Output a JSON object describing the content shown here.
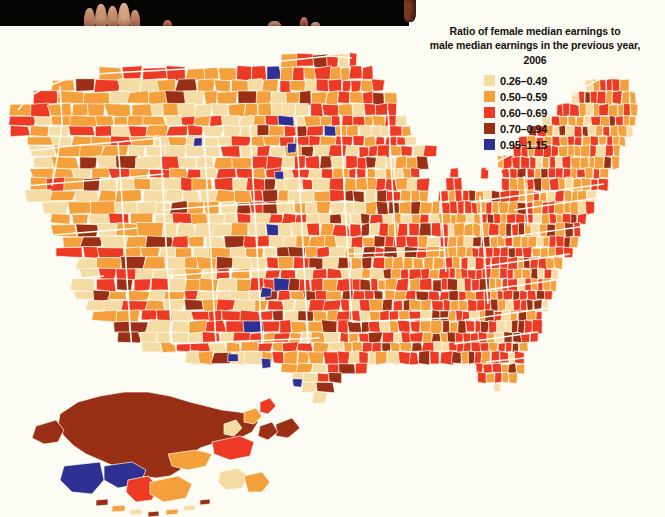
{
  "photo": {
    "band_color": "#060403",
    "description_name": "book-page-photo-band",
    "fingertips": 9
  },
  "legend": {
    "title_line1": "Ratio of female median earnings to",
    "title_line2": "male median earnings in the previous year,",
    "title_line3": "2006",
    "title_full": "Ratio of female median earnings to\nmale median earnings in the previous year,\n2006",
    "items": [
      {
        "label": "0.26–0.49",
        "color": "#f5dba4",
        "min": 0.26,
        "max": 0.49
      },
      {
        "label": "0.50–0.59",
        "color": "#f4a03c",
        "min": 0.5,
        "max": 0.59
      },
      {
        "label": "0.60–0.69",
        "color": "#ed3a24",
        "min": 0.6,
        "max": 0.69
      },
      {
        "label": "0.70–0.94",
        "color": "#993016",
        "min": 0.7,
        "max": 0.94
      },
      {
        "label": "0.95–1.15",
        "color": "#2e3192",
        "min": 0.95,
        "max": 1.15
      }
    ]
  },
  "map": {
    "name": "united-states-county-choropleth",
    "background": "#fdfcf4",
    "border_color": "#fdfcf4",
    "insets": [
      "Alaska",
      "Hawaii"
    ],
    "regions_summary": {
      "west_large_counties": "mostly 0.26–0.49 and 0.50–0.59",
      "southeast": "dense 0.60–0.69 with scattered 0.70–0.94",
      "northeast": "mixed 0.50–0.59 and 0.60–0.69",
      "great_plains_blue_outliers": 6,
      "alaska": "mostly 0.70–0.94 with 0.95–1.15 and 0.50–0.59 areas",
      "hawaii": "0.50–0.59 and 0.70–0.94"
    }
  },
  "chart_data": {
    "type": "map",
    "title": "Ratio of female median earnings to male median earnings in the previous year, 2006",
    "geography": "United States counties",
    "bins": [
      {
        "range": "0.26–0.49",
        "color": "#f5dba4"
      },
      {
        "range": "0.50–0.59",
        "color": "#f4a03c"
      },
      {
        "range": "0.60–0.69",
        "color": "#ed3a24"
      },
      {
        "range": "0.70–0.94",
        "color": "#993016"
      },
      {
        "range": "0.95–1.15",
        "color": "#2e3192"
      }
    ],
    "year": 2006
  }
}
